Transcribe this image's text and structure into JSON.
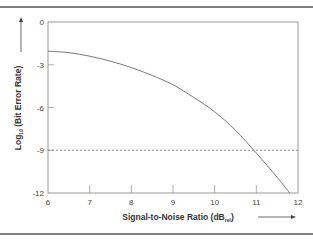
{
  "chart_data": {
    "type": "line",
    "title": "",
    "xlabel": "Signal-to-Noise Ratio (dB",
    "xlabel_sub": "rel",
    "xlabel_end": ")",
    "ylabel_prefix": "Log",
    "ylabel_sub": "10",
    "ylabel": " (Bit Error Rate)",
    "xlim": [
      6,
      12
    ],
    "ylim": [
      -12,
      0
    ],
    "xticks": [
      6,
      7,
      8,
      9,
      10,
      11,
      12
    ],
    "yticks": [
      0,
      -3,
      -6,
      -9,
      -12
    ],
    "xtick_labels": [
      "6",
      "7",
      "8",
      "9",
      "10",
      "11",
      "12"
    ],
    "ytick_labels": [
      "0",
      "-3",
      "-6",
      "-9",
      "-12"
    ],
    "grid": false,
    "series": [
      {
        "name": "BER curve",
        "x": [
          6,
          6.5,
          7,
          7.5,
          8,
          8.5,
          9,
          9.5,
          10,
          10.5,
          11,
          11.5,
          11.8
        ],
        "y": [
          -2.05,
          -2.15,
          -2.4,
          -2.75,
          -3.2,
          -3.75,
          -4.4,
          -5.3,
          -6.3,
          -7.6,
          -9.2,
          -10.9,
          -12
        ],
        "color": "#777777"
      }
    ],
    "reference_lines": [
      {
        "axis": "y",
        "value": -9,
        "style": "dashed",
        "color": "#777777"
      }
    ],
    "arrows": [
      "y-axis-up",
      "x-axis-right"
    ]
  }
}
